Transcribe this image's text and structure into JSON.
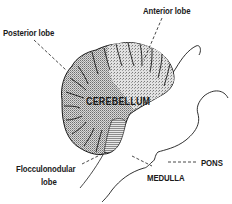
{
  "diagram": {
    "labels": {
      "anterior_lobe": "Anterior lobe",
      "posterior_lobe": "Posterior lobe",
      "cerebellum": "CEREBELLUM",
      "pons": "PONS",
      "flocculonodular_line1": "Flocculonodular",
      "flocculonodular_line2": "lobe",
      "medulla": "MEDULLA"
    },
    "colors": {
      "ink": "#1a1a1a",
      "stipple_dark": "#8a8a8a",
      "stipple_light": "#c8c8c8",
      "background": "#ffffff"
    }
  }
}
